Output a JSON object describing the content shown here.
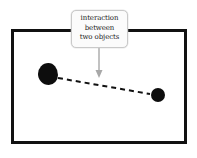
{
  "diagram": {
    "background_color": "#ffffff",
    "frame": {
      "name": "system-boundary",
      "x": 11,
      "y": 29,
      "width": 176,
      "height": 115,
      "border_color": "#111111",
      "border_width": 3,
      "fill": "none"
    },
    "objects": [
      {
        "label": "left-object",
        "shape": "blob",
        "color": "#0d0d0d",
        "cx": 48,
        "cy": 74,
        "rx": 10,
        "ry": 11
      },
      {
        "label": "right-object",
        "shape": "circle",
        "color": "#0d0d0d",
        "cx": 158,
        "cy": 95,
        "rx": 7,
        "ry": 7
      }
    ],
    "connector": {
      "name": "interaction-line",
      "style": "dashed",
      "color": "#111111",
      "stroke_width": 2,
      "dash_pattern": "5 4",
      "x1": 58,
      "y1": 78,
      "x2": 150,
      "y2": 94
    },
    "annotation": {
      "name": "interaction-callout",
      "lines": [
        "interaction",
        "between",
        "two objects"
      ],
      "text_color": "#1c1c1c",
      "box_fill": "#fbfbfb",
      "box_border": "#c9c9c9",
      "x": 71,
      "y": 10,
      "width": 57,
      "height": 38,
      "pointer": {
        "name": "callout-arrow",
        "color": "#a8a8a8",
        "stroke_width": 1.4,
        "x1": 99,
        "y1": 48,
        "x2": 99,
        "y2": 70,
        "head_width": 7,
        "head_height": 8
      }
    }
  }
}
